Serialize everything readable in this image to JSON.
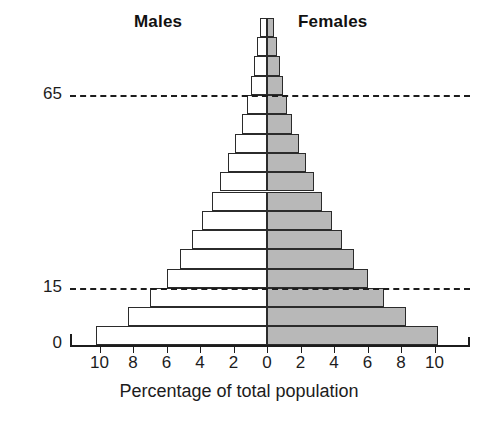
{
  "headings": {
    "left": "Males",
    "right": "Females"
  },
  "axis": {
    "x_title": "Percentage of total population",
    "x_tick_labels": [
      "10",
      "8",
      "6",
      "4",
      "2",
      "0",
      "2",
      "4",
      "6",
      "8",
      "10"
    ],
    "x_tick_values": [
      -10,
      -8,
      -6,
      -4,
      -2,
      0,
      2,
      4,
      6,
      8,
      10
    ],
    "y_reference_labels": [
      "65",
      "15",
      "0"
    ],
    "y_reference_values": [
      65,
      15,
      0
    ]
  },
  "colors": {
    "male_fill": "#ffffff",
    "female_fill": "#b8b8b8",
    "outline": "#2b2b2b",
    "axis": "#1c1c1c",
    "background": "#ffffff"
  },
  "chart_data": {
    "type": "bar",
    "subtype": "population-pyramid",
    "title": "",
    "xlabel": "Percentage of total population",
    "ylabel": "",
    "xlim": [
      -11,
      11
    ],
    "ylim": [
      0,
      85
    ],
    "grid": false,
    "legend_position": "top",
    "orientation": "horizontal-diverging",
    "categories": [
      "0-4",
      "5-9",
      "10-14",
      "15-19",
      "20-24",
      "25-29",
      "30-34",
      "35-39",
      "40-44",
      "45-49",
      "50-54",
      "55-59",
      "60-64",
      "65-69",
      "70-74",
      "75-79",
      "80+"
    ],
    "series": [
      {
        "name": "Males",
        "side": "left",
        "fill": "#ffffff",
        "values": [
          10.2,
          8.3,
          7.0,
          6.0,
          5.2,
          4.5,
          3.9,
          3.3,
          2.8,
          2.3,
          1.9,
          1.5,
          1.2,
          0.95,
          0.75,
          0.58,
          0.42
        ]
      },
      {
        "name": "Females",
        "side": "right",
        "fill": "#b8b8b8",
        "values": [
          10.2,
          8.3,
          7.0,
          6.0,
          5.2,
          4.5,
          3.9,
          3.3,
          2.8,
          2.3,
          1.9,
          1.5,
          1.2,
          0.95,
          0.75,
          0.58,
          0.42
        ]
      }
    ],
    "reference_lines": [
      {
        "value": 15,
        "label": "15",
        "style": "dashed"
      },
      {
        "value": 65,
        "label": "65",
        "style": "dashed"
      }
    ]
  }
}
